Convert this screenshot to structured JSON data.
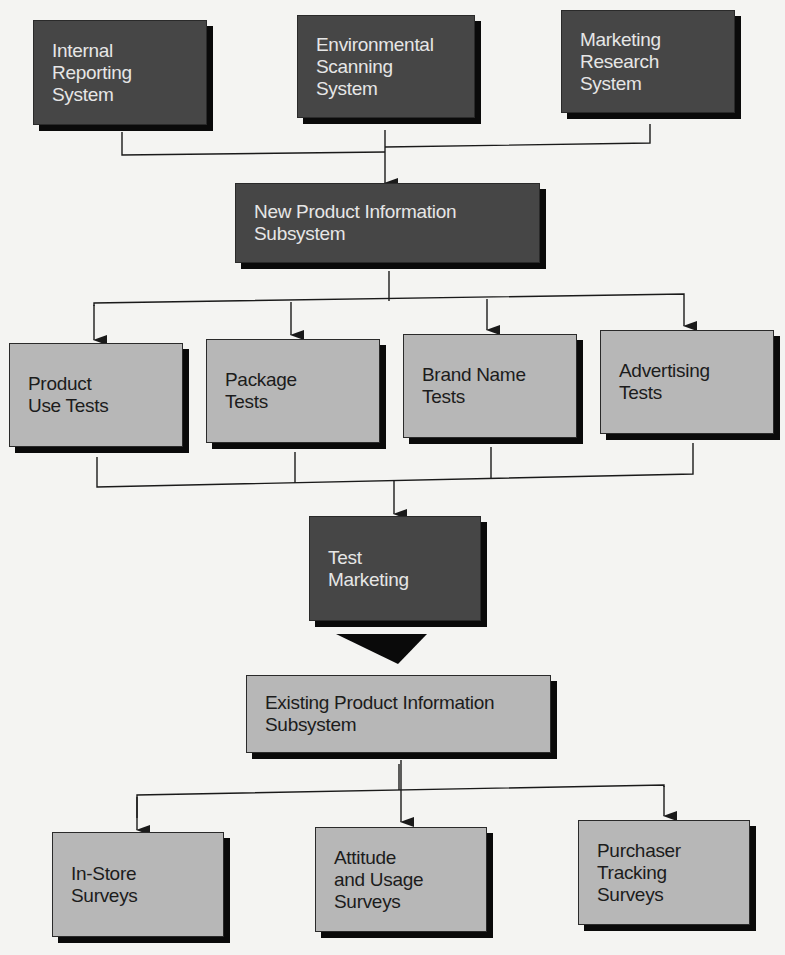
{
  "diagram": {
    "colors": {
      "dark_box": "#464646",
      "light_box": "#b7b7b7",
      "shadow": "#0a0a0a",
      "line": "#1a1a1a",
      "background": "#f4f4f2"
    },
    "sources": [
      {
        "id": "internal-reporting-system",
        "lines": [
          "Internal",
          "Reporting",
          "System"
        ],
        "style": "dark"
      },
      {
        "id": "environmental-scanning-system",
        "lines": [
          "Environmental",
          "Scanning",
          "System"
        ],
        "style": "dark"
      },
      {
        "id": "marketing-research-system",
        "lines": [
          "Marketing",
          "Research",
          "System"
        ],
        "style": "dark"
      }
    ],
    "new_product_subsystem": {
      "id": "new-product-information-subsystem",
      "lines": [
        "New Product Information",
        "Subsystem"
      ],
      "style": "dark"
    },
    "tests": [
      {
        "id": "product-use-tests",
        "lines": [
          "Product",
          "Use Tests"
        ],
        "style": "light"
      },
      {
        "id": "package-tests",
        "lines": [
          "Package",
          "Tests"
        ],
        "style": "light"
      },
      {
        "id": "brand-name-tests",
        "lines": [
          "Brand Name",
          "Tests"
        ],
        "style": "light"
      },
      {
        "id": "advertising-tests",
        "lines": [
          "Advertising",
          "Tests"
        ],
        "style": "light"
      }
    ],
    "test_marketing": {
      "id": "test-marketing",
      "lines": [
        "Test",
        "Marketing"
      ],
      "style": "dark"
    },
    "existing_product_subsystem": {
      "id": "existing-product-information-subsystem",
      "lines": [
        "Existing Product Information",
        "Subsystem"
      ],
      "style": "light"
    },
    "surveys": [
      {
        "id": "in-store-surveys",
        "lines": [
          "In-Store",
          "Surveys"
        ],
        "style": "light"
      },
      {
        "id": "attitude-and-usage-surveys",
        "lines": [
          "Attitude",
          "and Usage",
          "Surveys"
        ],
        "style": "light"
      },
      {
        "id": "purchaser-tracking-surveys",
        "lines": [
          "Purchaser",
          "Tracking",
          "Surveys"
        ],
        "style": "light"
      }
    ],
    "edges": [
      {
        "from": "internal-reporting-system",
        "to": "new-product-information-subsystem"
      },
      {
        "from": "environmental-scanning-system",
        "to": "new-product-information-subsystem"
      },
      {
        "from": "marketing-research-system",
        "to": "new-product-information-subsystem"
      },
      {
        "from": "new-product-information-subsystem",
        "to": "product-use-tests"
      },
      {
        "from": "new-product-information-subsystem",
        "to": "package-tests"
      },
      {
        "from": "new-product-information-subsystem",
        "to": "brand-name-tests"
      },
      {
        "from": "new-product-information-subsystem",
        "to": "advertising-tests"
      },
      {
        "from": "product-use-tests",
        "to": "test-marketing"
      },
      {
        "from": "package-tests",
        "to": "test-marketing"
      },
      {
        "from": "brand-name-tests",
        "to": "test-marketing"
      },
      {
        "from": "advertising-tests",
        "to": "test-marketing"
      },
      {
        "from": "test-marketing",
        "to": "existing-product-information-subsystem",
        "style": "large-triangle"
      },
      {
        "from": "existing-product-information-subsystem",
        "to": "in-store-surveys"
      },
      {
        "from": "existing-product-information-subsystem",
        "to": "attitude-and-usage-surveys"
      },
      {
        "from": "existing-product-information-subsystem",
        "to": "purchaser-tracking-surveys"
      }
    ]
  }
}
